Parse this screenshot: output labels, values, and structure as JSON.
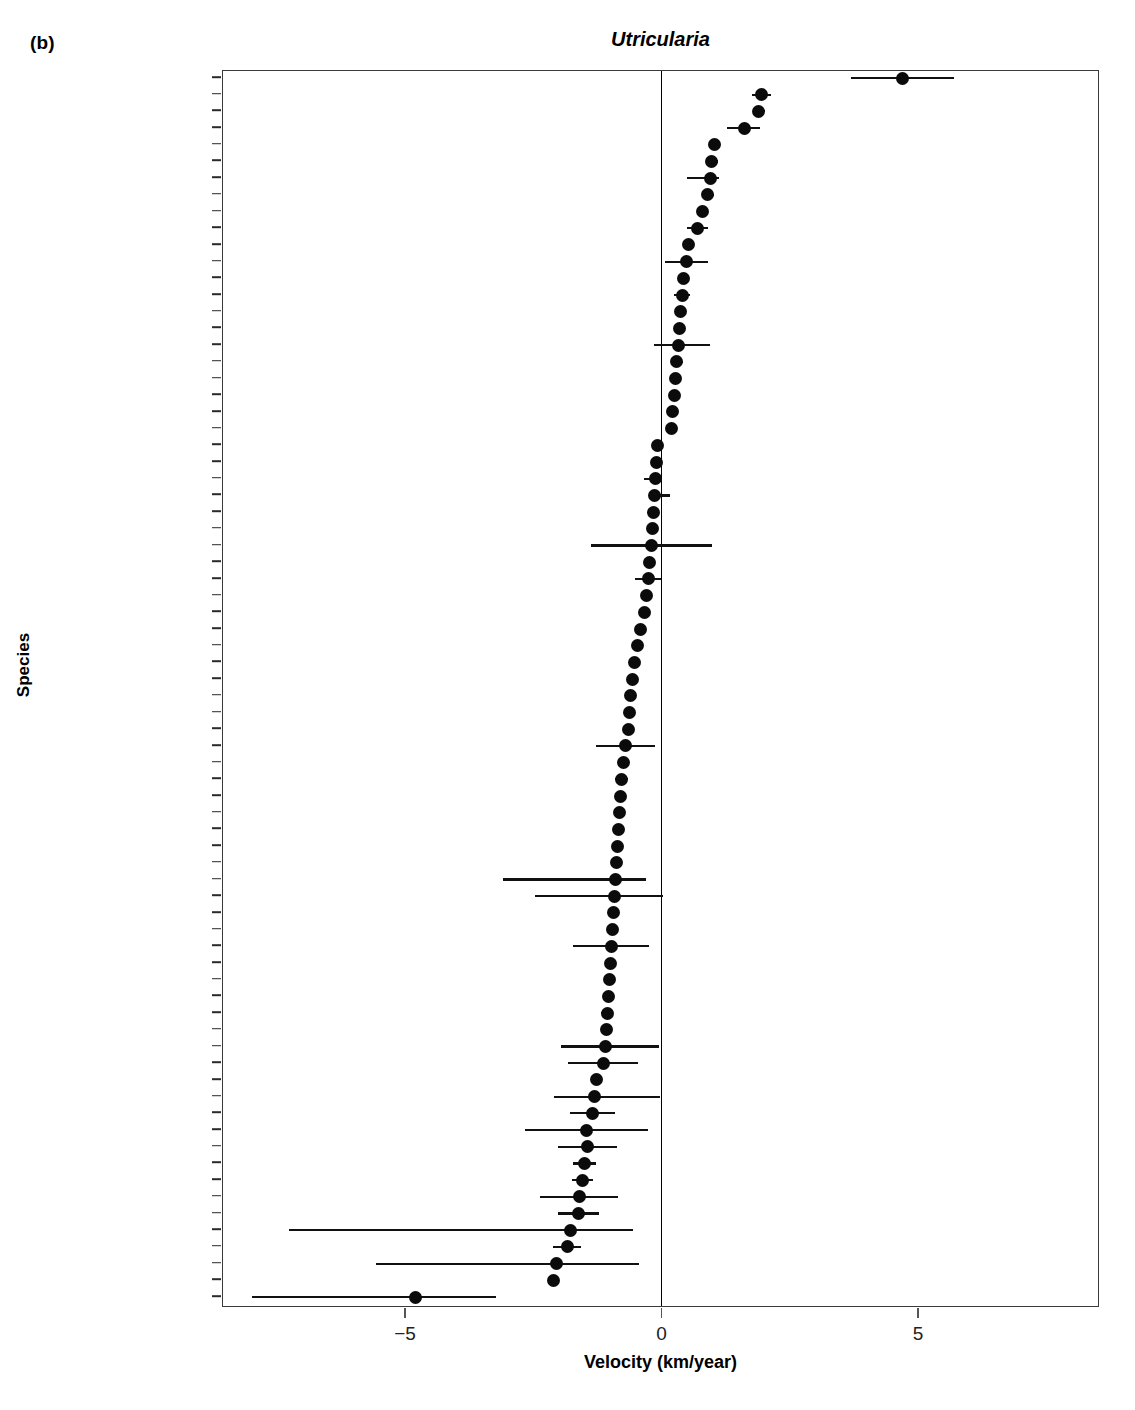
{
  "figure": {
    "panel_label": "(b)",
    "title": "Utricularia",
    "x_axis_title": "Velocity (km/year)",
    "y_axis_title": "Species"
  },
  "chart_data": {
    "type": "scatter",
    "subtype": "forest-plot",
    "title": "Utricularia",
    "xlabel": "Velocity (km/year)",
    "ylabel": "Species",
    "xlim": [
      -8.55,
      8.55
    ],
    "xticks": [
      -5,
      0,
      5
    ],
    "xtick_labels": [
      "−5",
      "0",
      "5"
    ],
    "grid": false,
    "legend": null,
    "zero_reference_line": 0,
    "orientation": "horizontal",
    "n_categories": 72,
    "categories": [
      "floridana",
      "resupinata",
      "inflata",
      "cornuta",
      "chrysantha",
      "odorata",
      "muelleri",
      "radiata",
      "limosa",
      "purpurea",
      "minutissima",
      "quinquedentata",
      "involvens",
      "juncea",
      "fulva",
      "leptoplectra",
      "striata",
      "lasiocaulis",
      "arnhemica",
      "tenuicaulis",
      "hydrocarpa",
      "leptorhyncha",
      "capilliflora",
      "caerulea",
      "circumvoluta",
      "kimberleyensis",
      "macrorhiza",
      "praetermissa",
      "trichophylla",
      "bifida",
      "triflora",
      "unifolia",
      "jamesoniana",
      "uniflora",
      "uliginosa",
      "inflexa",
      "stygia",
      "ochroleuca",
      "foliosa",
      "lateriflora",
      "guyanensis",
      "livida",
      "dichotoma",
      "amethystina",
      "intermedia",
      "minor",
      "hispida",
      "pubescens",
      "viscosa",
      "longeciliata",
      "multifida",
      "violacea",
      "flaccida",
      "tenella",
      "kamienskii",
      "vulgaris",
      "prehensilis",
      "subulata",
      "singeriana",
      "inaequalis",
      "beaugleholei",
      "fistulosa",
      "simulans",
      "dunlopii",
      "tubulata",
      "geminiscapa",
      "arenaria",
      "welwitschii",
      "reflexa",
      "andongensis",
      "praelonga",
      "bremii",
      "australis",
      "olivacea"
    ],
    "values": [
      4.7,
      1.95,
      1.9,
      1.62,
      1.04,
      0.98,
      0.96,
      0.9,
      0.8,
      0.7,
      0.52,
      0.48,
      0.42,
      0.4,
      0.38,
      0.36,
      0.33,
      0.3,
      0.28,
      0.25,
      0.22,
      0.2,
      -0.08,
      -0.1,
      -0.12,
      -0.14,
      -0.16,
      -0.18,
      -0.2,
      -0.24,
      -0.26,
      -0.3,
      -0.34,
      -0.4,
      -0.46,
      -0.52,
      -0.56,
      -0.6,
      -0.62,
      -0.64,
      -0.7,
      -0.74,
      -0.78,
      -0.8,
      -0.82,
      -0.84,
      -0.86,
      -0.88,
      -0.9,
      -0.92,
      -0.94,
      -0.96,
      -0.98,
      -1.0,
      -1.02,
      -1.04,
      -1.06,
      -1.08,
      -1.1,
      -1.14,
      -1.26,
      -1.3,
      -1.34,
      -1.46,
      -1.44,
      -1.5,
      -1.54,
      -1.6,
      -1.62,
      -1.78,
      -1.84,
      -2.04,
      -2.1,
      -4.8
    ],
    "ci_lower": [
      3.7,
      1.76,
      1.78,
      1.28,
      1.04,
      0.86,
      0.5,
      0.78,
      0.8,
      0.5,
      0.52,
      0.06,
      0.32,
      0.24,
      0.3,
      0.26,
      -0.14,
      0.18,
      0.22,
      0.25,
      0.14,
      0.1,
      -0.08,
      -0.1,
      -0.35,
      -0.14,
      -0.16,
      -0.18,
      -1.38,
      -0.24,
      -0.52,
      -0.3,
      -0.34,
      -0.4,
      -0.46,
      -0.52,
      -0.56,
      -0.6,
      -0.62,
      -0.64,
      -1.28,
      -0.74,
      -0.9,
      -0.8,
      -0.82,
      -0.84,
      -0.86,
      -0.88,
      -3.1,
      -2.46,
      -0.94,
      -0.96,
      -1.72,
      -1.0,
      -1.02,
      -1.04,
      -1.18,
      -1.08,
      -1.96,
      -1.82,
      -1.26,
      -2.1,
      -1.78,
      -2.66,
      -2.02,
      -1.72,
      -1.74,
      -2.36,
      -2.02,
      -7.26,
      -2.12,
      -5.56,
      -2.1,
      -7.98
    ],
    "ci_upper": [
      5.7,
      2.14,
      2.02,
      1.92,
      1.04,
      1.1,
      1.12,
      1.02,
      0.8,
      0.9,
      0.52,
      0.9,
      0.52,
      0.56,
      0.46,
      0.46,
      0.94,
      0.42,
      0.34,
      0.25,
      0.3,
      0.3,
      -0.08,
      -0.1,
      -0.12,
      0.16,
      -0.16,
      -0.18,
      0.98,
      -0.24,
      0.0,
      -0.3,
      -0.34,
      -0.4,
      -0.46,
      -0.52,
      -0.56,
      -0.6,
      -0.62,
      -0.64,
      -0.12,
      -0.74,
      -0.66,
      -0.8,
      -0.82,
      -0.84,
      -0.86,
      -0.88,
      -0.3,
      0.02,
      -0.94,
      -0.96,
      -0.24,
      -1.0,
      -1.02,
      -1.04,
      -0.94,
      -1.08,
      -0.04,
      -0.46,
      -1.26,
      -0.02,
      -0.9,
      -0.26,
      -0.86,
      -1.28,
      -1.34,
      -0.84,
      -1.22,
      -0.56,
      -1.56,
      -0.44,
      -2.1,
      -3.22
    ]
  }
}
